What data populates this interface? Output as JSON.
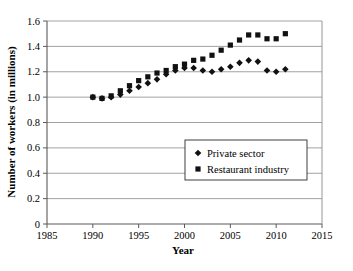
{
  "chart_data": {
    "type": "scatter",
    "title": "",
    "xlabel": "Year",
    "ylabel": "Number of workers (in millions)",
    "xlim": [
      1985,
      2015
    ],
    "ylim": [
      0,
      1.6
    ],
    "xticks": [
      1985,
      1990,
      1995,
      2000,
      2005,
      2010,
      2015
    ],
    "xtick_labels": [
      "1985",
      "1990",
      "1995",
      "2000",
      "2005",
      "2010",
      "2015"
    ],
    "yticks": [
      0,
      0.2,
      0.4,
      0.6,
      0.8,
      1.0,
      1.2,
      1.4,
      1.6
    ],
    "ytick_labels": [
      "0",
      "0.2",
      "0.4",
      "0.6",
      "0.8",
      "1.0",
      "1.2",
      "1.4",
      "1.6"
    ],
    "grid": true,
    "grid_axis": "y",
    "legend_position": "center-right",
    "x": [
      1990,
      1991,
      1992,
      1993,
      1994,
      1995,
      1996,
      1997,
      1998,
      1999,
      2000,
      2001,
      2002,
      2003,
      2004,
      2005,
      2006,
      2007,
      2008,
      2009,
      2010,
      2011
    ],
    "series": [
      {
        "name": "Private sector",
        "marker": "diamond",
        "color": "#111111",
        "values": [
          1.0,
          0.99,
          1.0,
          1.02,
          1.05,
          1.08,
          1.11,
          1.14,
          1.18,
          1.21,
          1.23,
          1.23,
          1.21,
          1.2,
          1.22,
          1.24,
          1.27,
          1.29,
          1.28,
          1.21,
          1.2,
          1.22
        ]
      },
      {
        "name": "Restaurant industry",
        "marker": "square",
        "color": "#111111",
        "values": [
          1.0,
          0.99,
          1.01,
          1.05,
          1.09,
          1.13,
          1.16,
          1.19,
          1.21,
          1.24,
          1.26,
          1.29,
          1.3,
          1.33,
          1.37,
          1.41,
          1.45,
          1.49,
          1.49,
          1.46,
          1.46,
          1.5
        ]
      }
    ]
  },
  "legend": {
    "entries": [
      {
        "label": "Private sector",
        "marker": "diamond"
      },
      {
        "label": "Restaurant industry",
        "marker": "square"
      }
    ]
  },
  "axes": {
    "x_title": "Year",
    "y_title": "Number of workers (in millions)"
  }
}
